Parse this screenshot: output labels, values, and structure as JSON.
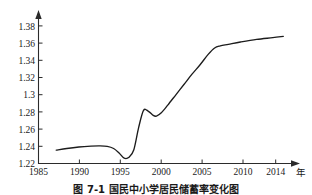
{
  "chart_data": {
    "type": "line",
    "title": "",
    "xlabel": "年",
    "ylabel": "",
    "xlim": [
      1985,
      2016.5
    ],
    "ylim": [
      1.22,
      1.385
    ],
    "grid": false,
    "legend": null,
    "x_ticks": [
      1985,
      1990,
      1995,
      2000,
      2005,
      2010,
      2014
    ],
    "x_tick_labels": [
      "1985",
      "1990",
      "1995",
      "2000",
      "2005",
      "2010",
      "2014"
    ],
    "y_ticks": [
      1.22,
      1.24,
      1.26,
      1.28,
      1.3,
      1.32,
      1.34,
      1.36,
      1.38
    ],
    "y_tick_labels": [
      "1.22",
      "1.24",
      "1.26",
      "1.28",
      "1.3",
      "1.32",
      "1.34",
      "1.36",
      "1.38"
    ],
    "series": [
      {
        "name": "",
        "color": "#1c1c1c",
        "x": [
          1987.2,
          1988.5,
          1990.0,
          1991.5,
          1992.5,
          1993.5,
          1994.3,
          1995.0,
          1995.6,
          1996.2,
          1996.8,
          1997.4,
          1998.0,
          1998.6,
          1999.2,
          1999.6,
          2000.2,
          2001.0,
          2002.0,
          2003.0,
          2004.0,
          2005.0,
          2006.0,
          2006.8,
          2007.5,
          2008.5,
          2010.0,
          2012.0,
          2014.0,
          2015.3
        ],
        "y": [
          1.2355,
          1.2375,
          1.2392,
          1.2402,
          1.2405,
          1.24,
          1.2375,
          1.232,
          1.2262,
          1.2272,
          1.236,
          1.262,
          1.2818,
          1.2808,
          1.276,
          1.2752,
          1.279,
          1.288,
          1.3,
          1.312,
          1.324,
          1.335,
          1.347,
          1.3545,
          1.357,
          1.3588,
          1.3615,
          1.3645,
          1.3665,
          1.368
        ]
      }
    ],
    "annotations": []
  },
  "axis": {
    "y_axis_name": "",
    "x_axis_name": "年"
  },
  "caption": {
    "text": "图 7-1  国民中小学居民储蓄率变化图"
  }
}
